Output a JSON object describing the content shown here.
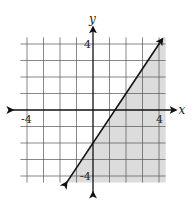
{
  "chart_data": {
    "type": "inequality-graph",
    "title": "",
    "xlabel": "x",
    "ylabel": "y",
    "xlim": [
      -4.4,
      4.4
    ],
    "ylim": [
      -4.4,
      4.4
    ],
    "grid": true,
    "grid_step": 1,
    "tick_labels": {
      "x": [
        {
          "value": -4,
          "label": "-4"
        },
        {
          "value": 4,
          "label": "4"
        }
      ],
      "y": [
        {
          "value": 4,
          "label": "4"
        },
        {
          "value": -4,
          "label": "-4"
        }
      ]
    },
    "boundary_line": {
      "equation": "y = 1.5x - 2",
      "slope": 1.5,
      "intercept": -2,
      "style": "solid",
      "arrows": "both",
      "from": [
        -1.6,
        -4.4
      ],
      "to": [
        4.2,
        4.3
      ]
    },
    "shaded_region": "below-right of line (y <= 1.5x - 2)",
    "colors": {
      "shade": "#dcdcdc",
      "grid": "#555555",
      "line": "#111111",
      "axis": "#111111"
    }
  }
}
